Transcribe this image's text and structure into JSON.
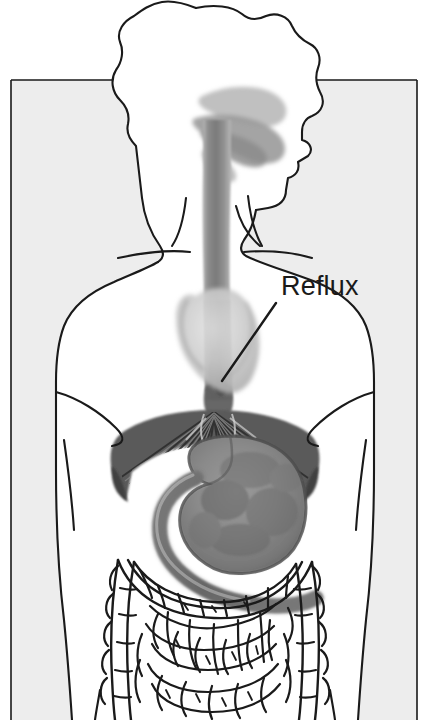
{
  "illustration": {
    "title": "Gastroesophageal Reflux Anatomical Diagram",
    "subject": "Female torso in frontal view showing digestive tract",
    "canvas": {
      "width": 429,
      "height": 720
    },
    "colors": {
      "background_panel": "#ededed",
      "page_background": "#ffffff",
      "outline": "#1a1a1a",
      "esophagus_gray": "#8a8a8a",
      "esophagus_dark": "#6f6f6f",
      "stomach_fill": "#8f8f8f",
      "stomach_dark": "#6a6a6a",
      "diaphragm_dark": "#4a4a4a",
      "heart_gray": "#c4c4c4",
      "cavity_gray": "#a8a8a8",
      "intestine_line": "#1a1a1a",
      "label_color": "#1a1a1a"
    }
  },
  "labels": {
    "reflux": {
      "text": "Reflux",
      "x": 281,
      "y": 295,
      "font_size": 27,
      "leader_line": {
        "x1": 276,
        "y1": 303,
        "x2": 222,
        "y2": 381
      }
    }
  },
  "structures": [
    {
      "name": "hair",
      "type": "outline",
      "shading": "none"
    },
    {
      "name": "face-profile",
      "type": "outline",
      "shading": "none"
    },
    {
      "name": "oral-nasal-cavity",
      "type": "shaded",
      "shading": "gray"
    },
    {
      "name": "neck",
      "type": "outline",
      "shading": "none"
    },
    {
      "name": "clavicle-left",
      "type": "line",
      "shading": "none"
    },
    {
      "name": "clavicle-right",
      "type": "line",
      "shading": "none"
    },
    {
      "name": "torso-outline",
      "type": "outline",
      "shading": "none"
    },
    {
      "name": "breast-contour-left",
      "type": "line",
      "shading": "none"
    },
    {
      "name": "breast-contour-right",
      "type": "line",
      "shading": "none"
    },
    {
      "name": "esophagus",
      "type": "shaded",
      "shading": "gray-tube"
    },
    {
      "name": "heart",
      "type": "shaded",
      "shading": "light-gray"
    },
    {
      "name": "lower-esophageal-sphincter",
      "type": "shaded",
      "shading": "dark-gray"
    },
    {
      "name": "diaphragm",
      "type": "shaded",
      "shading": "dark-striated"
    },
    {
      "name": "stomach",
      "type": "shaded",
      "shading": "mottled-gray"
    },
    {
      "name": "duodenum",
      "type": "shaded",
      "shading": "gray"
    },
    {
      "name": "transverse-colon",
      "type": "outline",
      "shading": "none"
    },
    {
      "name": "ascending-colon",
      "type": "outline",
      "shading": "none"
    },
    {
      "name": "descending-colon",
      "type": "outline",
      "shading": "none"
    },
    {
      "name": "small-intestine",
      "type": "outline",
      "shading": "none"
    },
    {
      "name": "hip-outline-left",
      "type": "line",
      "shading": "none"
    },
    {
      "name": "hip-outline-right",
      "type": "line",
      "shading": "none"
    }
  ]
}
